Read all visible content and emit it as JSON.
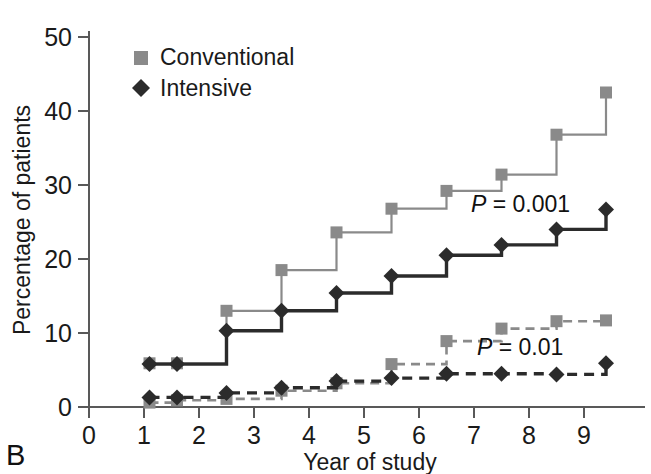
{
  "panel": {
    "label": "B"
  },
  "axes": {
    "y_title": "Percentage of patients",
    "x_title": "Year of study",
    "y_ticks": [
      "0",
      "10",
      "20",
      "30",
      "40",
      "50"
    ],
    "x_ticks": [
      "0",
      "1",
      "2",
      "3",
      "4",
      "5",
      "6",
      "7",
      "8",
      "9"
    ]
  },
  "legend": {
    "items": [
      {
        "label": "Conventional",
        "marker": "square",
        "color": "#8a8a8a"
      },
      {
        "label": "Intensive",
        "marker": "diamond",
        "color": "#2b2b2b"
      }
    ]
  },
  "annotations": [
    {
      "name": "p-value-upper",
      "prefix": "P",
      "text": " = 0.001"
    },
    {
      "name": "p-value-lower",
      "prefix": "P",
      "text": " = 0.01"
    }
  ],
  "chart_data": {
    "type": "line",
    "title": "",
    "xlabel": "Year of study",
    "ylabel": "Percentage of patients",
    "xlim": [
      0,
      9.5
    ],
    "ylim": [
      0,
      52
    ],
    "grid": false,
    "legend_position": "top-left",
    "step": "post",
    "x": [
      1.1,
      1.6,
      2.5,
      3.5,
      4.5,
      5.5,
      6.5,
      7.5,
      8.5,
      9.4
    ],
    "series": [
      {
        "name": "Conventional",
        "style": "solid",
        "color": "#8a8a8a",
        "marker": "square",
        "values": [
          5.9,
          5.9,
          13.0,
          18.5,
          23.6,
          26.8,
          29.2,
          31.4,
          36.8,
          42.5
        ]
      },
      {
        "name": "Intensive",
        "style": "solid",
        "color": "#2b2b2b",
        "marker": "diamond",
        "values": [
          5.8,
          5.8,
          10.3,
          13.0,
          15.4,
          17.7,
          20.5,
          21.9,
          24.0,
          26.7
        ]
      },
      {
        "name": "Conventional (secondary endpoint)",
        "style": "dashed",
        "color": "#8a8a8a",
        "marker": "square",
        "values": [
          0.6,
          0.9,
          1.1,
          2.2,
          3.2,
          5.8,
          8.9,
          10.6,
          11.6,
          11.7
        ]
      },
      {
        "name": "Intensive (secondary endpoint)",
        "style": "dashed",
        "color": "#2b2b2b",
        "marker": "diamond",
        "values": [
          1.3,
          1.3,
          1.9,
          2.6,
          3.5,
          3.9,
          4.5,
          4.5,
          4.4,
          5.9
        ]
      }
    ]
  }
}
